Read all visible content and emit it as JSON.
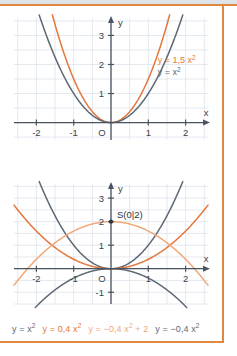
{
  "figure": {
    "frame_color": "#e0883f",
    "grid_color": "#dde3ec",
    "axis_color": "#4a5360",
    "curve_gray": "#5d6875",
    "curve_orange": "#e3773c",
    "curve_light_orange": "#f2a877"
  },
  "chart_data": [
    {
      "type": "line",
      "id": "upper",
      "title": "",
      "xlabel": "x",
      "ylabel": "y",
      "xlim": [
        -2.6,
        2.6
      ],
      "ylim": [
        -0.6,
        3.6
      ],
      "xticks": [
        -2,
        -1,
        1,
        2
      ],
      "xticklabels": [
        "-2",
        "-1",
        "1",
        "2"
      ],
      "yticks": [
        1,
        2,
        3
      ],
      "yticklabels": [
        "1",
        "2",
        "3"
      ],
      "origin_label": "O",
      "grid": true,
      "series": [
        {
          "name": "y = 1,5 x²",
          "label": "y = 1,5 x²",
          "color": "#e3773c",
          "formula": "1.5*x^2",
          "coefficient": 1.5
        },
        {
          "name": "y = x²",
          "label": "y = x²",
          "color": "#5d6875",
          "formula": "x^2",
          "coefficient": 1.0
        }
      ],
      "annotations": [
        {
          "text": "y = 1,5 x²",
          "x": 1.25,
          "y": 2.05,
          "color": "#e3773c"
        },
        {
          "text": "y = x²",
          "x": 1.25,
          "y": 1.65,
          "color": "#5d6875"
        }
      ]
    },
    {
      "type": "line",
      "id": "lower",
      "title": "",
      "xlabel": "x",
      "ylabel": "y",
      "xlim": [
        -2.6,
        2.6
      ],
      "ylim": [
        -1.5,
        3.6
      ],
      "xticks": [
        -2,
        -1,
        1,
        2
      ],
      "xticklabels": [
        "-2",
        "-1",
        "1",
        "2"
      ],
      "yticks": [
        -1,
        1,
        2,
        3
      ],
      "yticklabels": [
        "-1",
        "1",
        "2",
        "3"
      ],
      "origin_label": "O",
      "grid": true,
      "series": [
        {
          "name": "y = x²",
          "label": "y = x²",
          "color": "#5d6875",
          "formula": "x^2",
          "coefficient": 1.0,
          "offset": 0
        },
        {
          "name": "y = 0,4 x²",
          "label": "y = 0,4 x²",
          "color": "#e3773c",
          "formula": "0.4*x^2",
          "coefficient": 0.4,
          "offset": 0
        },
        {
          "name": "y = -0,4 x² + 2",
          "label": "y = −0,4 x² + 2",
          "color": "#f2a877",
          "formula": "-0.4*x^2+2",
          "coefficient": -0.4,
          "offset": 2
        },
        {
          "name": "y = -0,4 x²",
          "label": "y = −0,4 x²",
          "color": "#5d6875",
          "formula": "-0.4*x^2",
          "coefficient": -0.4,
          "offset": 0
        }
      ],
      "points": [
        {
          "name": "S",
          "label": "S(0|2)",
          "x": 0,
          "y": 2,
          "color": "#2d343d"
        }
      ]
    }
  ],
  "legend": {
    "items": [
      {
        "label": "y = x²",
        "color": "#5d6875"
      },
      {
        "label": "y = 0,4 x²",
        "color": "#e3773c"
      },
      {
        "label": "y = −0,4 x² + 2",
        "color": "#f2a877"
      },
      {
        "label": "y = −0,4 x²",
        "color": "#5d6875"
      }
    ]
  }
}
